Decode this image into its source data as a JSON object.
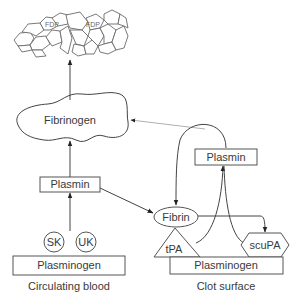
{
  "diagram": {
    "type": "fibrinolysis-pathway",
    "nodes": {
      "fdp": {
        "labels": [
          "FDP",
          "FDP"
        ]
      },
      "fibrinogen": {
        "label": "Fibrinogen"
      },
      "plasmin_blood": {
        "label": "Plasmin"
      },
      "plasmin_clot": {
        "label": "Plasmin"
      },
      "fibrin": {
        "label": "Fibrin"
      },
      "sk": {
        "label": "SK"
      },
      "uk": {
        "label": "UK"
      },
      "plasminogen_blood": {
        "label": "Plasminogen"
      },
      "plasminogen_clot": {
        "label": "Plasminogen"
      },
      "tpa": {
        "label": "tPA"
      },
      "scupa": {
        "label": "scuPA"
      }
    },
    "captions": {
      "left": "Circulating blood",
      "right": "Clot surface"
    },
    "edges": [
      {
        "from": "fibrinogen",
        "to": "fdp"
      },
      {
        "from": "plasmin_blood",
        "to": "fibrinogen"
      },
      {
        "from": "plasmin_blood",
        "to": "fibrin"
      },
      {
        "from": "sk_uk",
        "to": "plasmin_blood"
      },
      {
        "from": "plasmin_clot",
        "to": "fibrinogen",
        "style": "thin"
      },
      {
        "from": "plasmin_clot",
        "to": "fibrin"
      },
      {
        "from": "tpa",
        "to": "plasmin_clot"
      },
      {
        "from": "scupa",
        "to": "plasmin_clot"
      },
      {
        "from": "fibrin",
        "to": "scupa"
      }
    ],
    "colors": {
      "stroke": "#444444",
      "thin_stroke": "#9a9a9a",
      "text": "#3a3a3a",
      "background": "#ffffff"
    }
  }
}
